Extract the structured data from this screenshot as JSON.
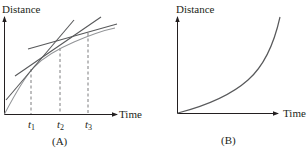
{
  "colors": {
    "axis": "#231f20",
    "curve": "#6d6e71",
    "tangent": "#58595b",
    "dashed": "#6d6e71"
  },
  "panels": [
    {
      "caption": "(A)",
      "y_label": "Distance",
      "x_label": "Time",
      "curve": "concave-down (decelerating)",
      "tangent_lines": 3,
      "time_marks": [
        {
          "symbol": "t",
          "subscript": "1"
        },
        {
          "symbol": "t",
          "subscript": "2"
        },
        {
          "symbol": "t",
          "subscript": "3"
        }
      ]
    },
    {
      "caption": "(B)",
      "y_label": "Distance",
      "x_label": "Time",
      "curve": "concave-up (accelerating)"
    }
  ]
}
